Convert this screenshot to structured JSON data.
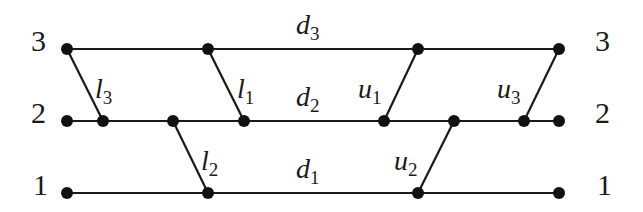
{
  "diagram": {
    "levels": [
      {
        "id": "3",
        "y": 49
      },
      {
        "id": "2",
        "y": 121
      },
      {
        "id": "1",
        "y": 193
      }
    ],
    "row_labels_left": [
      "3",
      "2",
      "1"
    ],
    "row_labels_right": [
      "3",
      "2",
      "1"
    ],
    "nodes": {
      "level3": [
        67,
        208,
        418,
        559
      ],
      "level2": [
        67,
        103,
        173,
        244,
        384,
        454,
        524,
        559
      ],
      "level1": [
        67,
        208,
        418,
        559
      ]
    },
    "horizontal_edges": [
      {
        "label": "d",
        "sub": "3",
        "level": "3"
      },
      {
        "label": "d",
        "sub": "2",
        "level": "2"
      },
      {
        "label": "d",
        "sub": "1",
        "level": "1"
      }
    ],
    "diagonal_edges": [
      {
        "label": "l",
        "sub": "3",
        "from": [
          67,
          49
        ],
        "to": [
          103,
          121
        ]
      },
      {
        "label": "l",
        "sub": "1",
        "from": [
          208,
          49
        ],
        "to": [
          244,
          121
        ]
      },
      {
        "label": "l",
        "sub": "2",
        "from": [
          173,
          121
        ],
        "to": [
          208,
          193
        ]
      },
      {
        "label": "u",
        "sub": "1",
        "from": [
          384,
          121
        ],
        "to": [
          418,
          49
        ]
      },
      {
        "label": "u",
        "sub": "3",
        "from": [
          524,
          121
        ],
        "to": [
          559,
          49
        ]
      },
      {
        "label": "u",
        "sub": "2",
        "from": [
          418,
          193
        ],
        "to": [
          454,
          121
        ]
      }
    ],
    "colors": {
      "line": "#1a1a1a",
      "node": "#111111",
      "background": "#ffffff"
    }
  }
}
